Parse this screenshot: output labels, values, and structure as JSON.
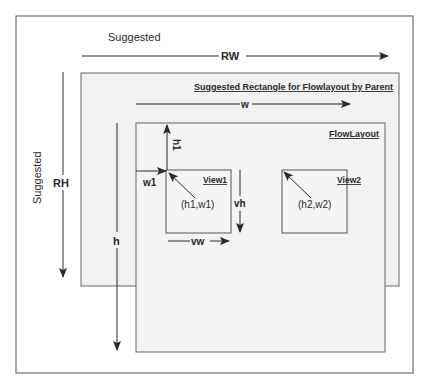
{
  "diagram": {
    "labels": {
      "suggested_top": "Suggested",
      "suggested_side": "Suggested",
      "rw": "RW",
      "rh": "RH",
      "w": "w",
      "h": "h",
      "h1": "h1",
      "w1": "w1",
      "vh": "vh",
      "vw": "vw",
      "suggested_rect_title": "Suggested Rectangle for Flowlayout by Parent",
      "flowlayout_title": "FlowLayout",
      "view1_title": "View1",
      "view2_title": "View2",
      "point1": "(h1,w1)",
      "point2": "(h2,w2)"
    },
    "colors": {
      "outer_border": "#555555",
      "box_fill": "#f1f1f1",
      "box_border": "#666666",
      "line": "#2a2a2a",
      "background": "#ffffff"
    }
  }
}
